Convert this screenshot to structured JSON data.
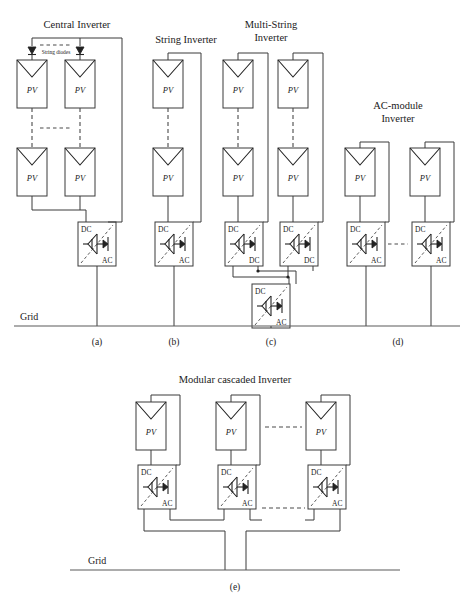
{
  "figure": {
    "page_header_partial": "",
    "grid_label": "Grid",
    "pv_label": "PV",
    "port_dc": "DC",
    "port_ac": "AC",
    "string_diode_label": "String diodes"
  },
  "panels": [
    {
      "id": "a",
      "caption": "(a)",
      "title": "Central Inverter",
      "title_lines": [
        "Central Inverter"
      ],
      "topology": "central-inverter",
      "pv_count_visible": 4,
      "inverter_count": 1,
      "converter_stages": [
        "DC/AC"
      ],
      "has_string_diodes": true,
      "series_dashes": 2,
      "parallel_dash": true
    },
    {
      "id": "b",
      "caption": "(b)",
      "title": "String Inverter",
      "title_lines": [
        "String Inverter"
      ],
      "topology": "string-inverter",
      "pv_count_visible": 2,
      "inverter_count": 1,
      "converter_stages": [
        "DC/AC"
      ],
      "has_string_diodes": false,
      "series_dashes": 1,
      "parallel_dash": false
    },
    {
      "id": "c",
      "caption": "(c)",
      "title": "Multi-String Inverter",
      "title_lines": [
        "Multi-String",
        "Inverter"
      ],
      "topology": "multi-string-inverter",
      "pv_count_visible": 4,
      "inverter_count": 1,
      "converter_stages": [
        "DC/DC",
        "DC/DC",
        "DC/AC"
      ],
      "has_string_diodes": false,
      "series_dashes": 2,
      "parallel_dash": false
    },
    {
      "id": "d",
      "caption": "(d)",
      "title": "AC-module Inverter",
      "title_lines": [
        "AC-module",
        "Inverter"
      ],
      "topology": "ac-module-inverter",
      "pv_count_visible": 2,
      "inverter_count": 2,
      "converter_stages": [
        "DC/AC",
        "DC/AC"
      ],
      "has_string_diodes": false,
      "series_dashes": 0,
      "parallel_dash": true
    },
    {
      "id": "e",
      "caption": "(e)",
      "title": "Modular cascaded Inverter",
      "title_lines": [
        "Modular cascaded Inverter"
      ],
      "topology": "modular-cascaded-inverter",
      "pv_count_visible": 3,
      "inverter_count": 3,
      "converter_stages": [
        "DC/AC",
        "DC/AC",
        "DC/AC"
      ],
      "has_string_diodes": false,
      "series_dashes": 0,
      "parallel_dash": true
    }
  ],
  "colors": {
    "wire": "#3a3a3a",
    "dash": "#4a4a4a",
    "text": "#1a1a1a",
    "background": "#ffffff",
    "grid": "#5a5a5a"
  }
}
